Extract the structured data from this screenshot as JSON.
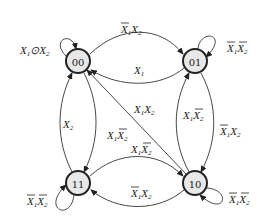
{
  "diagram": {
    "type": "state-diagram",
    "nodes": [
      {
        "id": "00",
        "label": "00"
      },
      {
        "id": "01",
        "label": "01"
      },
      {
        "id": "10",
        "label": "10"
      },
      {
        "id": "11",
        "label": "11"
      }
    ],
    "edges": [
      {
        "from": "00",
        "to": "00",
        "label": "X1⊙X2"
      },
      {
        "from": "00",
        "to": "01",
        "label": "X̄1X2"
      },
      {
        "from": "01",
        "to": "00",
        "label": "X1"
      },
      {
        "from": "01",
        "to": "01",
        "label": "X̄1X̄2"
      },
      {
        "from": "10",
        "to": "01",
        "label": "X1X̄2"
      },
      {
        "from": "01",
        "to": "10",
        "label": "X̄1X2"
      },
      {
        "from": "10",
        "to": "10",
        "label": "X̄1X̄2"
      },
      {
        "from": "10",
        "to": "00",
        "label": "X1X2"
      },
      {
        "from": "11",
        "to": "10",
        "label": "X1X̄2"
      },
      {
        "from": "10",
        "to": "11",
        "label": "X̄1X2"
      },
      {
        "from": "11",
        "to": "00",
        "label": "X2"
      },
      {
        "from": "00",
        "to": "11",
        "label": "X1X̄2"
      },
      {
        "from": "11",
        "to": "11",
        "label": "X̄1X̄2"
      }
    ]
  }
}
